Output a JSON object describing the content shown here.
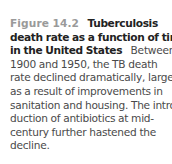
{
  "figure": {
    "label": "Figure 14.2",
    "title_lines": [
      "Tuberculosis",
      "death rate as a function of time",
      "in the United States"
    ],
    "body_lines": [
      "Between",
      "1900 and 1950, the TB death",
      "rate declined dramatically, largely",
      "as a result of improvements in",
      "sanitation and housing. The intro-",
      "duction of antibiotics at mid-",
      "century further hastened the",
      "decline."
    ]
  }
}
